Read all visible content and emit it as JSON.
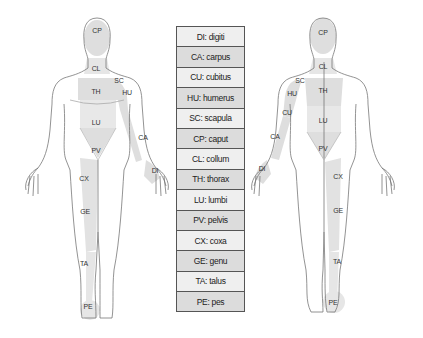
{
  "legend": {
    "rows": [
      {
        "code": "DI",
        "name": "digiti",
        "text": "DI: digiti"
      },
      {
        "code": "CA",
        "name": "carpus",
        "text": "CA: carpus"
      },
      {
        "code": "CU",
        "name": "cubitus",
        "text": "CU: cubitus"
      },
      {
        "code": "HU",
        "name": "humerus",
        "text": "HU: humerus"
      },
      {
        "code": "SC",
        "name": "scapula",
        "text": "SC: scapula"
      },
      {
        "code": "CP",
        "name": "caput",
        "text": "CP: caput"
      },
      {
        "code": "CL",
        "name": "collum",
        "text": "CL: collum"
      },
      {
        "code": "TH",
        "name": "thorax",
        "text": "TH: thorax"
      },
      {
        "code": "LU",
        "name": "lumbi",
        "text": "LU: lumbi"
      },
      {
        "code": "PV",
        "name": "pelvis",
        "text": "PV: pelvis"
      },
      {
        "code": "CX",
        "name": "coxa",
        "text": "CX: coxa"
      },
      {
        "code": "GE",
        "name": "genu",
        "text": "GE: genu"
      },
      {
        "code": "TA",
        "name": "talus",
        "text": "TA: talus"
      },
      {
        "code": "PE",
        "name": "pes",
        "text": "PE: pes"
      }
    ]
  },
  "front_figure": {
    "labels": {
      "CP": "CP",
      "CL": "CL",
      "SC": "SC",
      "HU": "HU",
      "TH": "TH",
      "LU": "LU",
      "CA": "CA",
      "PV": "PV",
      "DI": "DI",
      "CX": "CX",
      "GE": "GE",
      "TA": "TA",
      "PE": "PE"
    }
  },
  "back_figure": {
    "labels": {
      "CP": "CP",
      "CL": "CL",
      "SC": "SC",
      "HU": "HU",
      "TH": "TH",
      "CU": "CU",
      "LU": "LU",
      "CA": "CA",
      "PV": "PV",
      "DI": "DI",
      "CX": "CX",
      "GE": "GE",
      "TA": "TA",
      "PE": "PE"
    }
  },
  "colors": {
    "outline": "#666666",
    "shade": "#dcdcdc",
    "row_light": "#efefef",
    "row_dark": "#dcdcdc"
  }
}
